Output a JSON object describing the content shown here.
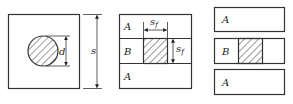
{
  "figure": {
    "panel_1": {
      "dimension_outer": "s",
      "dimension_inner": "d",
      "shape": "square-with-circular-hatched-inclusion"
    },
    "panel_2": {
      "rows": [
        {
          "label": "A"
        },
        {
          "label": "B"
        },
        {
          "label": "A"
        }
      ],
      "dimension_width": "s",
      "dimension_width_sub": "f",
      "dimension_height": "s",
      "dimension_height_sub": "f"
    },
    "panel_3": {
      "rows": [
        {
          "label": "A"
        },
        {
          "label": "B"
        },
        {
          "label": "A"
        }
      ]
    },
    "colors": {
      "line": "#333333",
      "background": "#ffffff"
    }
  }
}
